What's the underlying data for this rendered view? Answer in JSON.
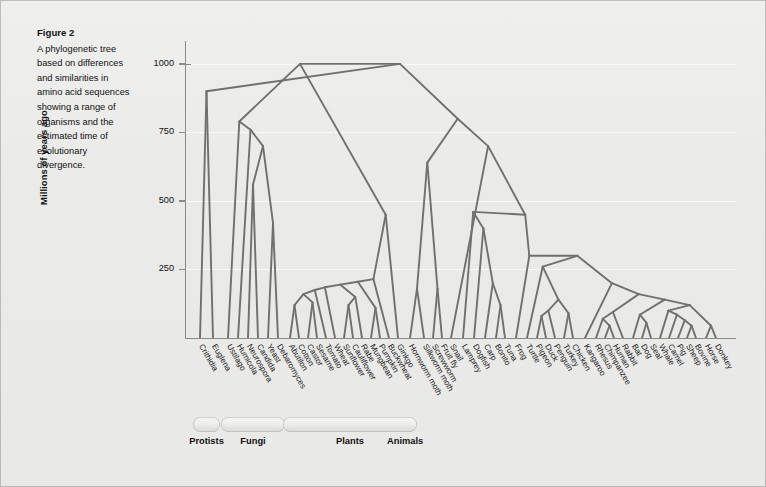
{
  "figure": {
    "title": "Figure 2",
    "caption": "A phylogenetic tree based on differences and similarities in amino acid sequences showing a range of organisms and the estimated time of evolutionary divergence."
  },
  "axis": {
    "ylabel": "Millions of years ago",
    "ticks": [
      "1000",
      "750",
      "500",
      "250"
    ],
    "tick_values": [
      1000,
      750,
      500,
      250
    ],
    "ymin": 0,
    "ymax": 1080
  },
  "groups": [
    {
      "label": "Protists",
      "first": 0,
      "last": 1
    },
    {
      "label": "Fungi",
      "first": 2,
      "last": 7
    },
    {
      "label": "Plants",
      "first": 8,
      "last": 21
    },
    {
      "label": "Animals",
      "first": 22,
      "last": 59
    }
  ],
  "chart_data": {
    "type": "tree",
    "title": "A phylogenetic tree based on differences and similarities in amino acid sequences",
    "xlabel": "",
    "ylabel": "Millions of years ago",
    "ylim": [
      0,
      1080
    ],
    "grid": true,
    "legend": "none",
    "units": "millions of years ago",
    "root_age": 1000,
    "taxa": [
      "Crithidia",
      "Euglena",
      "Ustilago",
      "Humicola",
      "Neurospora",
      "Candida",
      "Yeast",
      "Debaromyces",
      "Abutilon",
      "Cotton",
      "Castor",
      "Sesame",
      "Tomato",
      "Wheat",
      "Sunflower",
      "Cauliflower",
      "Rabe",
      "Mungbean",
      "Pumpkin",
      "Buckwheat",
      "Ginkgo",
      "Hornworm moth",
      "Silkworm moth",
      "Screwworm",
      "Fruit fly",
      "Snail",
      "Lamprey",
      "Dogfish",
      "Carp",
      "Bonito",
      "Tuna",
      "Frog",
      "Turtle",
      "Pigeon",
      "Duck",
      "Penguin",
      "Turkey",
      "Chicken",
      "Kangaroo",
      "Rhesus",
      "Chimpanzee",
      "Human",
      "Rabbit",
      "Bat",
      "Dog",
      "Seal",
      "Whale",
      "Camel",
      "Pig",
      "Sheep",
      "Bovine",
      "Horse",
      "Donkey"
    ],
    "taxa_full": [
      "Crithidia",
      "Euglena",
      "Ustilago",
      "Humicola",
      "Neurospora",
      "Candida",
      "Yeast",
      "Debaromyces",
      "Abutilon",
      "Cotton",
      "Castor",
      "Sesame",
      "Tomato",
      "Wheat",
      "Sunflower",
      "Cauliflower",
      "Rabe",
      "Mungbean",
      "Pumpkin",
      "Buckwheat",
      "Ginkgo",
      "Hornworm moth",
      "Silkworm moth",
      "Screwworm",
      "Fruit fly",
      "Snail",
      "Lamprey",
      "Dogfish",
      "Carp",
      "Bonito",
      "Tuna",
      "Frog",
      "Turtle",
      "Pigeon",
      "Duck",
      "Penguin",
      "Turkey",
      "Chicken",
      "Kangaroo",
      "Rhesus",
      "Chimpanzee",
      "Human",
      "Rabbit",
      "Bat",
      "Dog",
      "Seal",
      "Whale",
      "Camel",
      "Pig",
      "Sheep",
      "Bovine",
      "Horse",
      "Donkey"
    ],
    "node_ages": {
      "root": 1000,
      "protist_fungi": 900,
      "fungi_crown": 790,
      "plant_crown": 450,
      "animal_crown": 800,
      "insect_crown": 640,
      "vertebrate_crown": 450,
      "bird_mammal": 300,
      "mammal_crown": 170,
      "primate": 70
    },
    "line_color": "#70716f",
    "plot_bg": "#ebebe9"
  },
  "colors": {
    "page_bg": "#ececeb",
    "tree_line": "#70716f",
    "axis": "#8a8a88",
    "text": "#1a1a1a",
    "grid": "#ffffff"
  }
}
